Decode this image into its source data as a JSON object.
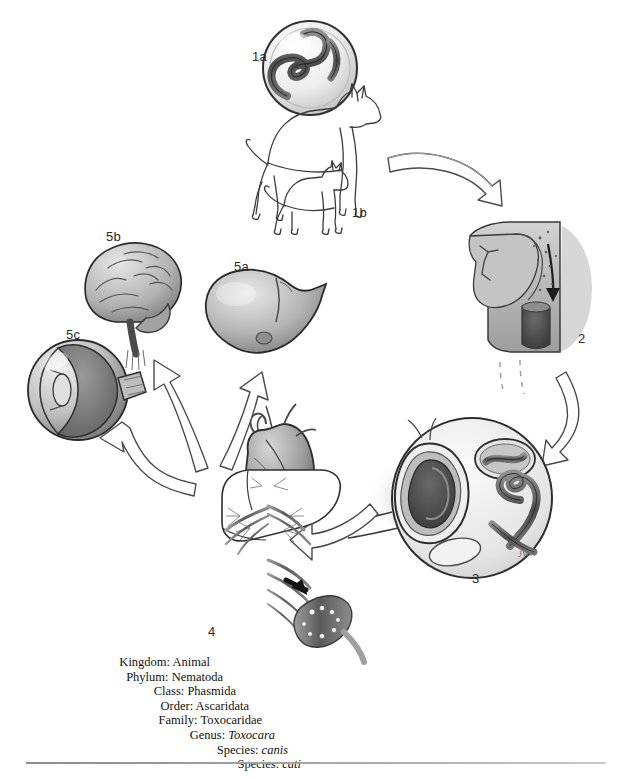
{
  "figure": {
    "palette": {
      "ink": "#1a1a1a",
      "outline": "#3a3a3a",
      "tissue_light": "#d8d8d8",
      "tissue_mid": "#a9a9a9",
      "tissue_dark": "#6e6e6e",
      "arrow_fill": "#ffffff",
      "arrow_stroke": "#4a4a4a",
      "background": "#ffffff"
    },
    "artist_signature": "JWK"
  },
  "stages": [
    {
      "id": "1a",
      "label": "1a",
      "name": "embryonated-egg",
      "description": "Embryonated egg containing coiled infective larva",
      "x": 252,
      "y": 58
    },
    {
      "id": "1b",
      "label": "1b",
      "name": "definitive-hosts",
      "description": "Definitive hosts: dog and cat",
      "x": 352,
      "y": 212
    },
    {
      "id": "2",
      "label": "2",
      "name": "ingestion-oral-cavity",
      "description": "Ingestion of eggs; sagittal section of oral cavity and pharynx with swallowing arrow",
      "x": 578,
      "y": 338
    },
    {
      "id": "3",
      "label": "3",
      "name": "intestinal-hatching",
      "description": "Eggs hatch in the small intestine releasing larvae",
      "x": 472,
      "y": 578
    },
    {
      "id": "4",
      "label": "4",
      "name": "portal-circulation",
      "description": "Larvae penetrate intestinal wall and migrate via portal circulation to liver and heart",
      "x": 212,
      "y": 632
    },
    {
      "id": "5a",
      "label": "5a",
      "name": "liver",
      "description": "Liver — visceral larva migrans",
      "x": 240,
      "y": 267
    },
    {
      "id": "5b",
      "label": "5b",
      "name": "brain",
      "description": "Brain — neural larva migrans",
      "x": 112,
      "y": 237
    },
    {
      "id": "5c",
      "label": "5c",
      "name": "eye",
      "description": "Eye — ocular larva migrans",
      "x": 72,
      "y": 335
    }
  ],
  "taxonomy": [
    {
      "rank": "Kingdom:",
      "value": "Animal",
      "italic": false
    },
    {
      "rank": "Phylum:",
      "value": "Nematoda",
      "italic": false
    },
    {
      "rank": "Class:",
      "value": "Phasmida",
      "italic": false
    },
    {
      "rank": "Order:",
      "value": "Ascaridata",
      "italic": false
    },
    {
      "rank": "Family:",
      "value": "Toxocaridae",
      "italic": false
    },
    {
      "rank": "Genus:",
      "value": "Toxocara",
      "italic": true
    },
    {
      "rank": "Species:",
      "value": "canis",
      "italic": true
    },
    {
      "rank": "Species:",
      "value": "cati",
      "italic": true
    }
  ]
}
